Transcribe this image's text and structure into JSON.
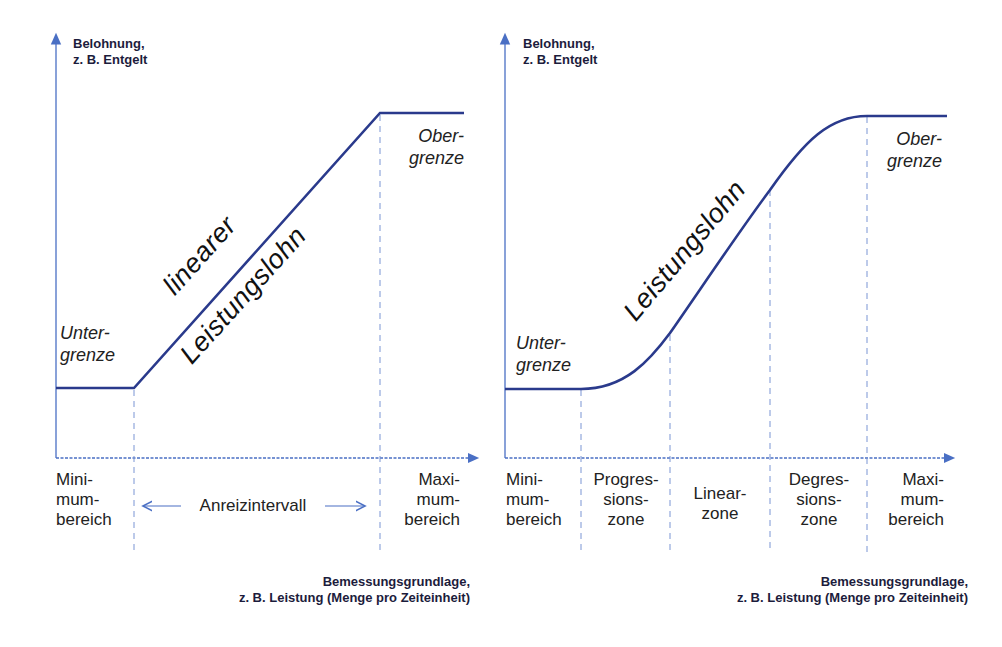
{
  "colors": {
    "axis": "#4a6fc4",
    "curve": "#2a3a8c",
    "dash": "#7b95d4",
    "text": "#1f1f3a"
  },
  "left_chart": {
    "y_axis_title_line1": "Belohnung,",
    "y_axis_title_line2": "z. B. Entgelt",
    "x_axis_title_line1": "Bemessungsgrundlage,",
    "x_axis_title_line2": "z. B. Leistung (Menge pro Zeiteinheit)",
    "lower_limit_line1": "Unter-",
    "lower_limit_line2": "grenze",
    "upper_limit_line1": "Ober-",
    "upper_limit_line2": "grenze",
    "curve_label_top": "linearer",
    "curve_label_bottom": "Leistungslohn",
    "zones": {
      "min_line1": "Mini-",
      "min_line2": "mum-",
      "min_line3": "bereich",
      "incentive": "Anreizintervall",
      "max_line1": "Maxi-",
      "max_line2": "mum-",
      "max_line3": "bereich"
    }
  },
  "right_chart": {
    "y_axis_title_line1": "Belohnung,",
    "y_axis_title_line2": "z. B. Entgelt",
    "x_axis_title_line1": "Bemessungsgrundlage,",
    "x_axis_title_line2": "z. B. Leistung (Menge pro Zeiteinheit)",
    "lower_limit_line1": "Unter-",
    "lower_limit_line2": "grenze",
    "upper_limit_line1": "Ober-",
    "upper_limit_line2": "grenze",
    "curve_label": "Leistungslohn",
    "zones": [
      {
        "line1": "Mini-",
        "line2": "mum-",
        "line3": "bereich"
      },
      {
        "line1": "Progres-",
        "line2": "sions-",
        "line3": "zone"
      },
      {
        "line1": "Linear-",
        "line2": "zone",
        "line3": ""
      },
      {
        "line1": "Degres-",
        "line2": "sions-",
        "line3": "zone"
      },
      {
        "line1": "Maxi-",
        "line2": "mum-",
        "line3": "bereich"
      }
    ]
  }
}
